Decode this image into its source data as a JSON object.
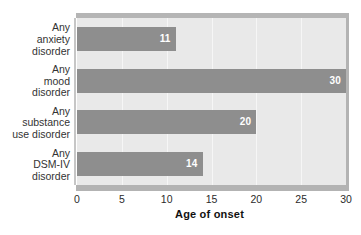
{
  "chart_data": {
    "type": "bar",
    "orientation": "horizontal",
    "title": "",
    "xlabel": "Age of onset",
    "ylabel": "",
    "categories": [
      "Any\nanxiety\ndisorder",
      "Any\nmood\ndisorder",
      "Any\nsubstance\nuse disorder",
      "Any\nDSM-IV\ndisorder"
    ],
    "values": [
      11,
      30,
      20,
      14
    ],
    "value_labels": [
      "11",
      "30",
      "20",
      "14"
    ],
    "xlim": [
      0,
      30
    ],
    "xticks": [
      0,
      5,
      10,
      15,
      20,
      25,
      30
    ],
    "xtick_labels": [
      "0",
      "5",
      "10",
      "15",
      "20",
      "25",
      "30"
    ],
    "grid": true,
    "legend": "none",
    "colors": {
      "bar": "#8e8e8e",
      "plot_background": "#e9e9e9",
      "gridline": "#f6f6f6",
      "frame": "#b3b3b3",
      "value_label": "#ffffff",
      "tick_label": "#2b2b2b",
      "category_label": "#333333",
      "axis_title": "#111111",
      "page_background": "#ffffff"
    }
  }
}
